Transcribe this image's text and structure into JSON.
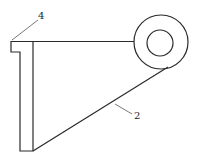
{
  "diagram": {
    "type": "technical-drawing",
    "labels": [
      {
        "id": "label-4",
        "text": "4",
        "x": 39,
        "y": 19
      },
      {
        "id": "label-2",
        "text": "2",
        "x": 134,
        "y": 119
      }
    ],
    "colors": {
      "line": "#2a2a2a",
      "background": "#ffffff"
    }
  }
}
